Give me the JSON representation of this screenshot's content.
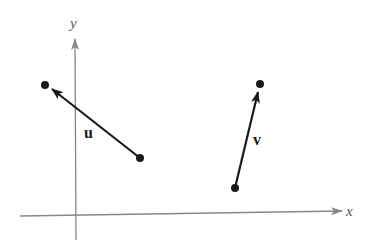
{
  "diagram": {
    "type": "vector-diagram",
    "axes": {
      "x_label": "x",
      "y_label": "y",
      "color": "#888888"
    },
    "vectors": [
      {
        "name": "u",
        "label": "u",
        "tail": [
          140,
          158
        ],
        "head": [
          45,
          85
        ],
        "color": "#1a1a1a"
      },
      {
        "name": "v",
        "label": "v",
        "tail": [
          235,
          188
        ],
        "head": [
          260,
          84
        ],
        "color": "#1a1a1a"
      }
    ]
  }
}
